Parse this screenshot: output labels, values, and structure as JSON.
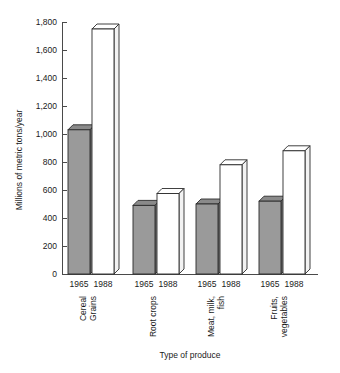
{
  "chart_data": {
    "type": "bar",
    "title": "",
    "xlabel": "Type of produce",
    "ylabel": "Millions of metric tons/year",
    "categories": [
      "Cereal Grains",
      "Root crops",
      "Meat, milk, fish",
      "Fruits, vegetables"
    ],
    "category_lines": [
      [
        "Cereal",
        "Grains"
      ],
      [
        "Root crops"
      ],
      [
        "Meat, milk,",
        "fish"
      ],
      [
        "Fruits,",
        "vegetables"
      ]
    ],
    "series": [
      {
        "name": "1965",
        "values": [
          1030,
          490,
          500,
          520
        ]
      },
      {
        "name": "1988",
        "values": [
          1750,
          575,
          780,
          880
        ]
      }
    ],
    "ylim": [
      0,
      1800
    ],
    "yticks": [
      0,
      200,
      400,
      600,
      800,
      1000,
      1200,
      1400,
      1600,
      1800
    ],
    "ytick_labels": [
      "0",
      "200",
      "400",
      "600",
      "800",
      "1,000",
      "1,200",
      "1,400",
      "1,600",
      "1,800"
    ],
    "grid": false,
    "legend": "none",
    "style": "3d-blocks",
    "colors": {
      "series_1965_fill": "#9a9a9a",
      "series_1988_fill": "#ffffff",
      "outline": "#2b2b2b",
      "axis": "#4a4a4a",
      "background": "#ffffff"
    }
  }
}
